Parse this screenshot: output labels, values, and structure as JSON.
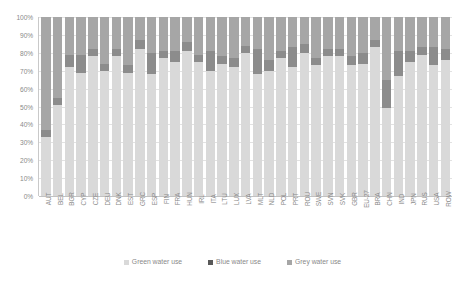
{
  "chart_data": {
    "type": "bar",
    "subtype": "stacked-percentage",
    "title": "",
    "xlabel": "",
    "ylabel": "",
    "ylim": [
      0,
      100
    ],
    "grid": true,
    "legend_position": "bottom",
    "ytick_labels": [
      "100%",
      "90%",
      "80%",
      "70%",
      "60%",
      "50%",
      "40%",
      "30%",
      "20%",
      "10%",
      "0%"
    ],
    "ytick_values": [
      100,
      90,
      80,
      70,
      60,
      50,
      40,
      30,
      20,
      10,
      0
    ],
    "categories": [
      "AUT",
      "BEL",
      "BGR",
      "CYP",
      "CZE",
      "DEU",
      "DNK",
      "EST",
      "GRC",
      "ESP",
      "FIN",
      "FRA",
      "HUN",
      "IRL",
      "ITA",
      "LTU",
      "LUX",
      "LVA",
      "MLT",
      "NLD",
      "POL",
      "PRT",
      "ROU",
      "SWE",
      "SVN",
      "SVK",
      "GBR",
      "EU-27",
      "BRA",
      "CHN",
      "IND",
      "JPN",
      "RUS",
      "USA",
      "ROW"
    ],
    "series": [
      {
        "name": "Green water use",
        "color": "#d9d9d9",
        "values": [
          33,
          51,
          72,
          69,
          78,
          70,
          78,
          69,
          82,
          68,
          77,
          75,
          81,
          75,
          70,
          74,
          72,
          80,
          68,
          70,
          77,
          72,
          80,
          73,
          78,
          78,
          73,
          74,
          83,
          49,
          67,
          75,
          79,
          73,
          76
        ]
      },
      {
        "name": "Blue water use",
        "color": "#8c8c8c",
        "values": [
          4,
          4,
          7,
          10,
          4,
          4,
          4,
          4,
          5,
          12,
          4,
          6,
          5,
          4,
          11,
          4,
          5,
          4,
          14,
          6,
          4,
          11,
          5,
          4,
          4,
          4,
          5,
          6,
          4,
          16,
          14,
          6,
          4,
          10,
          6
        ]
      },
      {
        "name": "Grey water use",
        "color": "#a6a6a6",
        "values": [
          63,
          45,
          21,
          21,
          18,
          26,
          18,
          27,
          13,
          20,
          19,
          19,
          14,
          21,
          19,
          22,
          23,
          16,
          18,
          24,
          19,
          17,
          15,
          23,
          18,
          18,
          22,
          20,
          13,
          35,
          19,
          19,
          17,
          17,
          18
        ]
      }
    ]
  },
  "legend": {
    "items": [
      {
        "label": "Green water use",
        "color": "#d9d9d9"
      },
      {
        "label": "Blue water use",
        "color": "#595959"
      },
      {
        "label": "Grey water use",
        "color": "#a6a6a6"
      }
    ]
  },
  "colors": {
    "grid": "#e2e2e2",
    "axis": "#c2c2c2",
    "text": "#8a8a8a",
    "background": "#ffffff"
  }
}
